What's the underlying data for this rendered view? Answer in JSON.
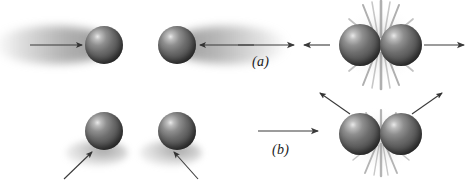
{
  "figure": {
    "background_color": "#ffffff",
    "width": 469,
    "height": 181,
    "sphere_color": "#5a5a5a",
    "arrow_color": "#3a3a3a",
    "trail_color": "#b8b8b8",
    "burst_color": "#9a9a9a"
  },
  "rows": [
    {
      "key": "a",
      "label": "(a)",
      "description": "Head-on collision: two spheres approach along the same line with motion-blur trails and rebound straight back along the same line.",
      "before": {
        "spheres": [
          {
            "name": "sphere-a-left-before",
            "cx": 104,
            "cy": 45,
            "r": 19
          },
          {
            "name": "sphere-a-right-before",
            "cx": 177,
            "cy": 45,
            "r": 19
          }
        ],
        "arrows": [
          {
            "name": "arrow-a-incoming-left",
            "direction": "right",
            "x1": 30,
            "y1": 45,
            "x2": 84,
            "y2": 45
          },
          {
            "name": "arrow-a-incoming-right",
            "direction": "left",
            "x1": 252,
            "y1": 45,
            "x2": 197,
            "y2": 45
          }
        ],
        "trails": [
          {
            "name": "trail-a-left",
            "side": "left"
          },
          {
            "name": "trail-a-right",
            "side": "right"
          }
        ]
      },
      "transition": {
        "arrows": [
          {
            "name": "arrow-a-transition-right",
            "direction": "right",
            "x1": 238,
            "y1": 45,
            "x2": 296,
            "y2": 45
          },
          {
            "name": "arrow-a-transition-left",
            "direction": "left",
            "x1": 320,
            "y1": 45,
            "x2": 304,
            "y2": 45
          }
        ]
      },
      "after": {
        "spheres": [
          {
            "name": "sphere-a-left-after",
            "cx": 360,
            "cy": 45,
            "r": 21
          },
          {
            "name": "sphere-a-right-after",
            "cx": 401,
            "cy": 45,
            "r": 21
          }
        ],
        "arrows": [
          {
            "name": "arrow-a-outgoing-left",
            "direction": "left",
            "x1": 320,
            "y1": 45,
            "x2": 304,
            "y2": 45
          },
          {
            "name": "arrow-a-outgoing-right",
            "direction": "right",
            "x1": 424,
            "y1": 45,
            "x2": 466,
            "y2": 45
          }
        ],
        "impact": {
          "name": "burst-a",
          "cx": 381,
          "cy": 45,
          "spikes": 16
        }
      }
    },
    {
      "key": "b",
      "label": "(b)",
      "description": "Glancing collision: two spheres are struck from below along diagonals and scatter outward and upward at an angle.",
      "before": {
        "spheres": [
          {
            "name": "sphere-b-left-before",
            "cx": 104,
            "cy": 131,
            "r": 19
          },
          {
            "name": "sphere-b-right-before",
            "cx": 177,
            "cy": 131,
            "r": 19
          }
        ],
        "arrows": [
          {
            "name": "arrow-b-incoming-left",
            "direction": "up-right",
            "x1": 66,
            "y1": 178,
            "x2": 94,
            "y2": 152
          },
          {
            "name": "arrow-b-incoming-right",
            "direction": "up-left",
            "x1": 196,
            "y1": 178,
            "x2": 172,
            "y2": 152
          }
        ]
      },
      "transition": {
        "arrows": [
          {
            "name": "arrow-b-transition",
            "direction": "right",
            "x1": 258,
            "y1": 131,
            "x2": 320,
            "y2": 131
          }
        ]
      },
      "after": {
        "spheres": [
          {
            "name": "sphere-b-left-after",
            "cx": 360,
            "cy": 134,
            "r": 21
          },
          {
            "name": "sphere-b-right-after",
            "cx": 401,
            "cy": 134,
            "r": 21
          }
        ],
        "arrows": [
          {
            "name": "arrow-b-outgoing-left",
            "direction": "up-left",
            "x1": 348,
            "y1": 112,
            "x2": 318,
            "y2": 92
          },
          {
            "name": "arrow-b-outgoing-right",
            "direction": "up-right",
            "x1": 414,
            "y1": 112,
            "x2": 443,
            "y2": 92
          }
        ],
        "impact": {
          "name": "burst-b",
          "cx": 381,
          "cy": 142,
          "spikes": 14
        }
      }
    }
  ]
}
